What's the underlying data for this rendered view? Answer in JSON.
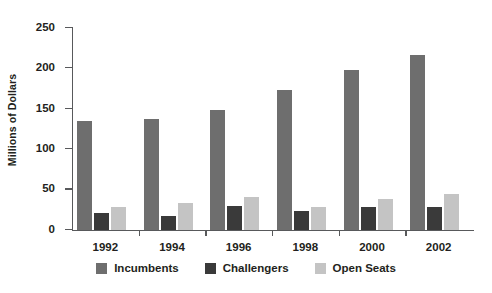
{
  "chart_data": {
    "type": "bar",
    "title": "",
    "subtitle": "",
    "xlabel": "",
    "ylabel": "Millions of Dollars",
    "categories": [
      "1992",
      "1994",
      "1996",
      "1998",
      "2000",
      "2002"
    ],
    "series": [
      {
        "name": "Incumbents",
        "color": "#6e6e6e",
        "values": [
          135,
          138,
          148,
          173,
          198,
          217
        ]
      },
      {
        "name": "Challengers",
        "color": "#3a3a3a",
        "values": [
          21,
          17,
          30,
          23,
          28,
          29
        ]
      },
      {
        "name": "Open Seats",
        "color": "#c4c4c4",
        "values": [
          29,
          34,
          41,
          28,
          39,
          44
        ]
      }
    ],
    "ylim": [
      0,
      250
    ],
    "yticks": [
      0,
      50,
      100,
      150,
      200,
      250
    ],
    "ytick_labels": [
      "0",
      "50",
      "100",
      "150",
      "200",
      "250"
    ],
    "grid": false,
    "legend_position": "bottom",
    "axis_color": "#58595b",
    "text_color": "#231f20",
    "background": "#ffffff"
  }
}
